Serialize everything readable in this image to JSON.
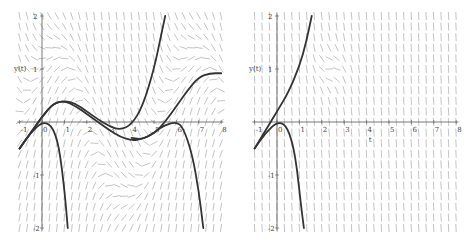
{
  "chart_data": [
    {
      "type": "line",
      "subtype": "direction-field",
      "title": "",
      "xlabel": "",
      "ylabel": "y(t)",
      "xlim": [
        -1,
        8
      ],
      "ylim": [
        -2,
        2
      ],
      "xticks": [
        "-1",
        "0",
        "1",
        "2",
        "3",
        "4",
        "5",
        "6",
        "7",
        "8"
      ],
      "yticks": [
        "-2",
        "-1",
        "1",
        "2"
      ],
      "grid": false,
      "slope_field": "dense grey arrows, oscillating field",
      "series": [
        {
          "name": "solution-1",
          "points": [
            [
              -1,
              -0.5
            ],
            [
              -0.5,
              -0.2
            ],
            [
              0,
              0.1
            ],
            [
              0.5,
              0.35
            ],
            [
              1,
              0.4
            ],
            [
              1.5,
              0.35
            ],
            [
              2,
              0.2
            ],
            [
              2.5,
              0.05
            ],
            [
              3,
              -0.08
            ],
            [
              3.5,
              -0.15
            ],
            [
              4,
              -0.05
            ],
            [
              4.5,
              0.3
            ],
            [
              5,
              1.0
            ],
            [
              5.3,
              1.6
            ],
            [
              5.5,
              2.0
            ]
          ]
        },
        {
          "name": "solution-2",
          "points": [
            [
              -1,
              -0.5
            ],
            [
              -0.5,
              -0.2
            ],
            [
              0,
              0.1
            ],
            [
              0.5,
              0.35
            ],
            [
              1,
              0.4
            ],
            [
              1.5,
              0.3
            ],
            [
              2,
              0.15
            ],
            [
              2.5,
              0
            ],
            [
              3,
              -0.15
            ],
            [
              3.5,
              -0.28
            ],
            [
              4,
              -0.35
            ],
            [
              4.5,
              -0.32
            ],
            [
              5,
              -0.22
            ],
            [
              5.5,
              0
            ],
            [
              6,
              0.3
            ],
            [
              6.5,
              0.6
            ],
            [
              7,
              0.85
            ],
            [
              7.5,
              0.92
            ],
            [
              8,
              0.92
            ]
          ]
        },
        {
          "name": "solution-3",
          "points": [
            [
              -1,
              -0.5
            ],
            [
              -0.5,
              -0.2
            ],
            [
              0,
              0
            ],
            [
              0.4,
              -0.05
            ],
            [
              0.7,
              -0.35
            ],
            [
              0.9,
              -0.9
            ],
            [
              1.05,
              -1.5
            ],
            [
              1.15,
              -2.0
            ]
          ]
        },
        {
          "name": "solution-4",
          "points": [
            [
              4,
              -0.3
            ],
            [
              4.5,
              -0.33
            ],
            [
              5,
              -0.2
            ],
            [
              5.5,
              -0.05
            ],
            [
              6,
              0
            ],
            [
              6.3,
              -0.1
            ],
            [
              6.7,
              -0.6
            ],
            [
              7,
              -1.3
            ],
            [
              7.2,
              -2.0
            ]
          ]
        }
      ]
    },
    {
      "type": "line",
      "subtype": "direction-field",
      "title": "",
      "xlabel": "t",
      "ylabel": "y(t)",
      "xlim": [
        -1,
        8
      ],
      "ylim": [
        -2,
        2
      ],
      "xticks": [
        "-1",
        "0",
        "1",
        "2",
        "3",
        "4",
        "5",
        "6",
        "7",
        "8"
      ],
      "yticks": [
        "-2",
        "-1",
        "1",
        "2"
      ],
      "grid": false,
      "slope_field": "dense grey arrows, mostly vertical downward",
      "series": [
        {
          "name": "solution-1",
          "points": [
            [
              -1,
              -0.5
            ],
            [
              -0.5,
              -0.15
            ],
            [
              0,
              0.2
            ],
            [
              0.5,
              0.55
            ],
            [
              1,
              1.05
            ],
            [
              1.3,
              1.5
            ],
            [
              1.55,
              2.0
            ]
          ]
        },
        {
          "name": "solution-2",
          "points": [
            [
              -1,
              -0.5
            ],
            [
              -0.5,
              -0.2
            ],
            [
              0,
              0
            ],
            [
              0.4,
              -0.05
            ],
            [
              0.7,
              -0.4
            ],
            [
              0.9,
              -0.9
            ],
            [
              1.05,
              -1.5
            ],
            [
              1.2,
              -2.0
            ]
          ]
        }
      ]
    }
  ]
}
